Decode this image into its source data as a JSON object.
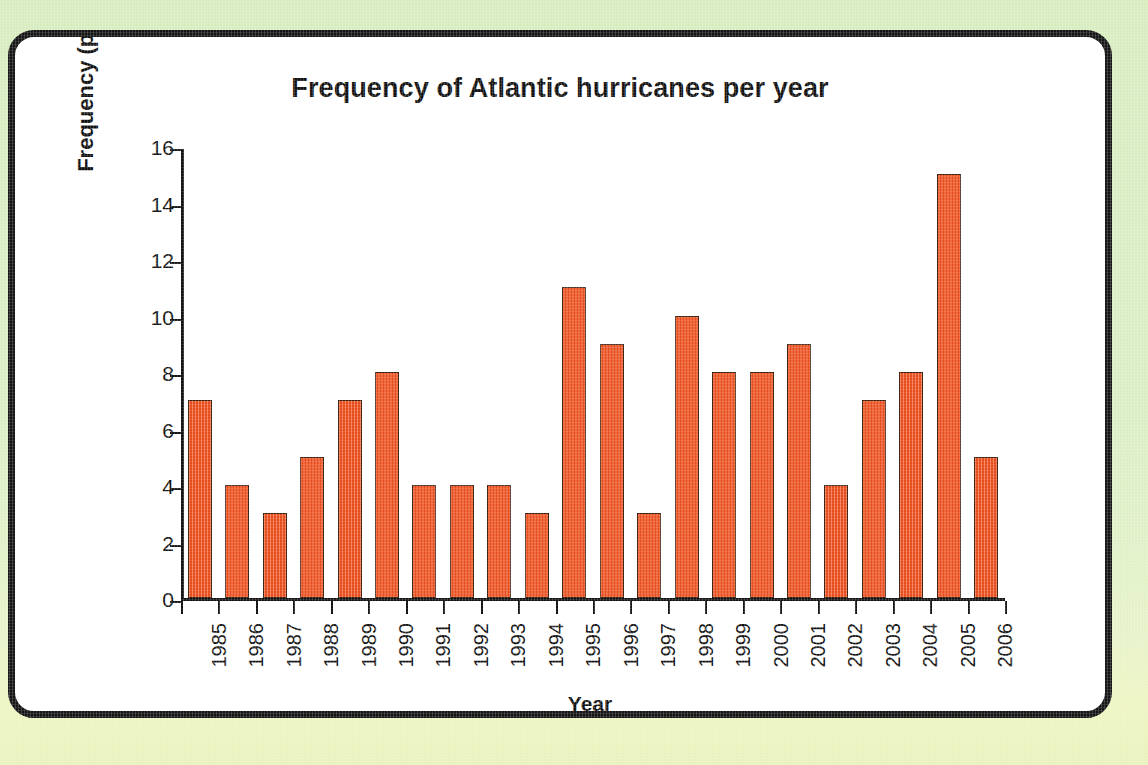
{
  "chart_data": {
    "type": "bar",
    "title": "Frequency of Atlantic hurricanes per year",
    "xlabel": "Year",
    "ylabel": "Frequency (per year)",
    "categories": [
      "1985",
      "1986",
      "1987",
      "1988",
      "1989",
      "1990",
      "1991",
      "1992",
      "1993",
      "1994",
      "1995",
      "1996",
      "1997",
      "1998",
      "1999",
      "2000",
      "2001",
      "2002",
      "2003",
      "2004",
      "2005",
      "2006"
    ],
    "values": [
      7,
      4,
      3,
      5,
      7,
      8,
      4,
      4,
      4,
      3,
      11,
      9,
      3,
      10,
      8,
      8,
      9,
      4,
      7,
      8,
      15,
      5
    ],
    "ylim": [
      0,
      16
    ],
    "ytick_labels": [
      "0",
      "2",
      "4",
      "6",
      "8",
      "10",
      "12",
      "14",
      "16"
    ],
    "ytick_values": [
      0,
      2,
      4,
      6,
      8,
      10,
      12,
      14,
      16
    ],
    "grid": false,
    "legend": "none",
    "bar_color": "#f2511e",
    "bar_edge_color": "#3b2010",
    "axis_color": "#111111",
    "plot_background": "#ffffff",
    "page_background": "#d8edc0",
    "frame_color": "#151515"
  }
}
